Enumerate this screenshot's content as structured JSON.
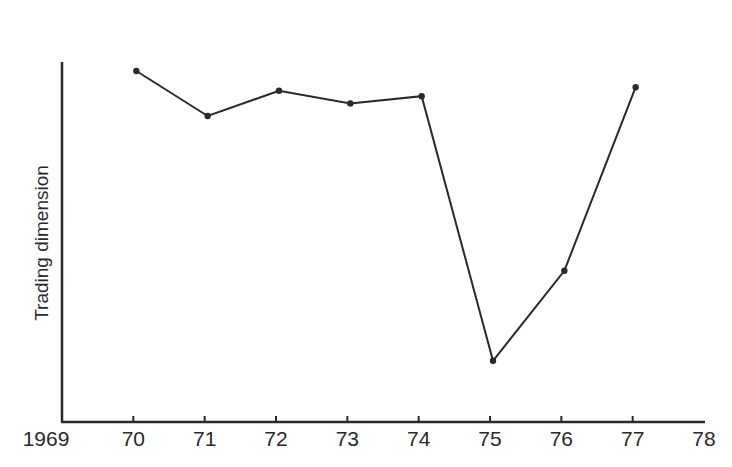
{
  "chart_data": {
    "type": "line",
    "title": "",
    "xlabel": "",
    "ylabel": "Trading dimension",
    "x_tick_labels": [
      "1969",
      "70",
      "71",
      "72",
      "73",
      "74",
      "75",
      "76",
      "77",
      "78"
    ],
    "categories": [
      "70",
      "71",
      "72",
      "73",
      "74",
      "75",
      "76",
      "77"
    ],
    "series": [
      {
        "name": "Trading dimension",
        "values": [
          97.5,
          85,
          92,
          88.5,
          90.5,
          17,
          42,
          93
        ]
      }
    ],
    "ylim": [
      0,
      100
    ],
    "y_ticks_shown": false,
    "grid": false,
    "legend": "none",
    "markers": true,
    "line_color": "#2a2a2a"
  }
}
